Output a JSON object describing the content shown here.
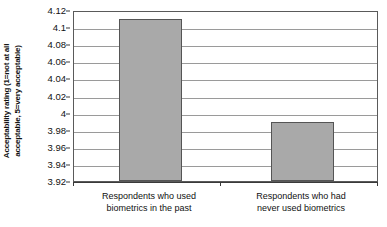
{
  "chart_data": {
    "type": "bar",
    "title": "",
    "xlabel": "",
    "ylabel": "Acceptability rating (1=not at all acceptable, 5=very acceptable)",
    "ylabel_line1": "Acceptability rating (1=not at all",
    "ylabel_line2": "acceptable, 5=very acceptable)",
    "categories": [
      "Respondents who used biometrics in the past",
      "Respondents who had never used biometrics"
    ],
    "category_lines": [
      {
        "line1": "Respondents who used",
        "line2": "biometrics in the past"
      },
      {
        "line1": "Respondents who had",
        "line2": "never used biometrics"
      }
    ],
    "values": [
      4.109,
      3.989
    ],
    "ylim": [
      3.92,
      4.12
    ],
    "ytick_step": 0.02,
    "ytick_labels": [
      "4.12",
      "4.1",
      "4.08",
      "4.06",
      "4.04",
      "4.02",
      "4",
      "3.98",
      "3.96",
      "3.94",
      "3.92"
    ],
    "ytick_values": [
      4.12,
      4.1,
      4.08,
      4.06,
      4.04,
      4.02,
      4.0,
      3.98,
      3.96,
      3.94,
      3.92
    ],
    "grid": true,
    "grid_axis": "y",
    "legend": false,
    "legend_position": "none",
    "colors": {
      "bar_fill": "#a9a9a9",
      "bar_stroke": "#555555",
      "gridline": "#9a9a9a",
      "axis": "#3a3a3a",
      "plot_border": "#5a5a5a",
      "text": "#111111",
      "background": "#ffffff"
    }
  }
}
